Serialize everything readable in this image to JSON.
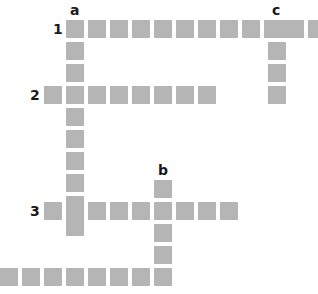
{
  "puzzle": {
    "type": "crossword-grid",
    "cell_color": "#b5b5b5",
    "cell_size": 18,
    "pitch": 22,
    "labels": [
      {
        "id": "label-a",
        "text": "a",
        "x": 70,
        "y": 3
      },
      {
        "id": "label-c",
        "text": "c",
        "x": 272,
        "y": 3
      },
      {
        "id": "label-b",
        "text": "b",
        "x": 158,
        "y": 163
      },
      {
        "id": "label-1",
        "text": "1",
        "x": 53,
        "y": 22
      },
      {
        "id": "label-2",
        "text": "2",
        "x": 30,
        "y": 88
      },
      {
        "id": "label-3",
        "text": "3",
        "x": 30,
        "y": 204
      }
    ],
    "words": [
      {
        "id": "across-1",
        "direction": "across",
        "start_x": 66,
        "start_y": 20,
        "length": 12
      },
      {
        "id": "across-2",
        "direction": "across",
        "start_x": 44,
        "start_y": 86,
        "length": 8
      },
      {
        "id": "across-3",
        "direction": "across",
        "start_x": 44,
        "start_y": 202,
        "length": 9
      },
      {
        "id": "across-bottom",
        "direction": "across",
        "start_x": 0,
        "start_y": 268,
        "length": 8
      },
      {
        "id": "down-a",
        "direction": "down",
        "start_x": 66,
        "start_y": 20,
        "length": 10
      },
      {
        "id": "down-b",
        "direction": "down",
        "start_x": 154,
        "start_y": 180,
        "length": 5
      },
      {
        "id": "down-c",
        "direction": "down",
        "start_x": 268,
        "start_y": 20,
        "length": 4
      }
    ]
  }
}
